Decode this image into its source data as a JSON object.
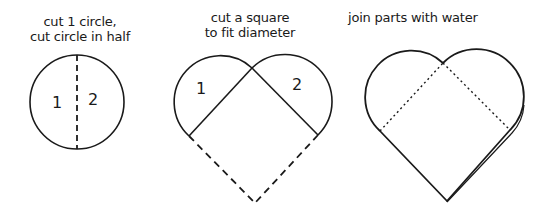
{
  "steps": [
    {
      "caption_line1": "cut 1 circle,",
      "caption_line2": "cut circle in half",
      "part_labels": [
        "1",
        "2"
      ]
    },
    {
      "caption_line1": "cut a square",
      "caption_line2": "to fit diameter",
      "part_labels": [
        "1",
        "2"
      ]
    },
    {
      "caption_line1": "join parts with water"
    }
  ],
  "colors": {
    "stroke": "#1a1a1a",
    "background": "#ffffff"
  }
}
